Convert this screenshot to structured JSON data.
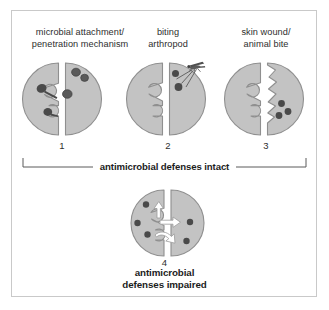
{
  "figure": {
    "panels": [
      {
        "id": "panel-1",
        "caption_lines": [
          "microbial attachment/",
          "penetration mechanism"
        ],
        "number": "1",
        "icon": "split-cell-with-microbes-icon"
      },
      {
        "id": "panel-2",
        "caption_lines": [
          "biting",
          "arthropod"
        ],
        "number": "2",
        "icon": "split-cell-with-arthropod-icon"
      },
      {
        "id": "panel-3",
        "caption_lines": [
          "skin wound/",
          "animal bite"
        ],
        "number": "3",
        "icon": "split-cell-torn-edge-icon"
      }
    ],
    "bracket": {
      "label": "antimicrobial defenses intact"
    },
    "bottom_panel": {
      "id": "panel-4",
      "number": "4",
      "label_lines": [
        "antimicrobial",
        "defenses impaired"
      ],
      "icon": "split-cell-invaded-icon"
    },
    "colors": {
      "cell_fill": "#c3c3c3",
      "cell_stroke": "#8f8f8f",
      "microbe_dark": "#4c4c4c",
      "microbe_mid": "#6e6e6e",
      "notch_white": "#ffffff",
      "arrow_white": "#ffffff",
      "frame_border": "#c9c9c9",
      "text_body": "#2e2e2e",
      "text_bold": "#1c1c1c",
      "background": "#ffffff"
    }
  }
}
